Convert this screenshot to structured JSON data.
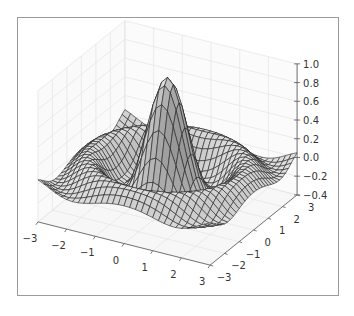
{
  "chart_data": {
    "type": "surface3d",
    "title": "",
    "function": "sin(R)/R, R = sqrt(x^2+y^2) scaled",
    "x_ticks": [
      -3,
      -2,
      -1,
      0,
      1,
      2,
      3
    ],
    "y_ticks": [
      -3,
      -2,
      -1,
      0,
      1,
      2,
      3
    ],
    "z_ticks": [
      -0.4,
      -0.2,
      0.0,
      0.2,
      0.4,
      0.6,
      0.8,
      1.0
    ],
    "x_tick_labels": [
      "−3",
      "−2",
      "−1",
      "0",
      "1",
      "2",
      "3"
    ],
    "y_tick_labels": [
      "−3",
      "−2",
      "−1",
      "0",
      "1",
      "2",
      "3"
    ],
    "z_tick_labels": [
      "−0.4",
      "−0.2",
      "0.0",
      "0.2",
      "0.4",
      "0.6",
      "0.8",
      "1.0"
    ],
    "xlim": [
      -3,
      3
    ],
    "ylim": [
      -3,
      3
    ],
    "zlim": [
      -0.4,
      1.0
    ],
    "grid": true,
    "surface_color": "#c8c8c8",
    "edge_color": "#222222",
    "peak_value": 1.0,
    "mesh_resolution": 30
  }
}
